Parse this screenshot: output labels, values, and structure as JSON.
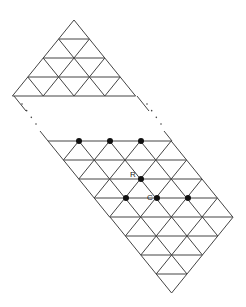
{
  "diagram": {
    "type": "triangular-lattice",
    "line_color": "#444444",
    "dot_color": "#111111",
    "geometry": {
      "half_side": 15.4,
      "row_height": 19
    },
    "top_triangle": {
      "apex": [
        74,
        20
      ],
      "rows": 4
    },
    "ellipsis_left": {
      "from": [
        22,
        104
      ],
      "to": [
        36,
        124
      ],
      "text": "..."
    },
    "ellipsis_right": {
      "from": [
        147,
        104
      ],
      "to": [
        161,
        124
      ],
      "text": "..."
    },
    "gap_edges": [
      {
        "from": [
          14,
          96
        ],
        "to": [
          26,
          111
        ]
      },
      {
        "from": [
          40,
          131
        ],
        "to": [
          48,
          141
        ]
      },
      {
        "from": [
          137,
          96
        ],
        "to": [
          149,
          111
        ]
      },
      {
        "from": [
          164,
          131
        ],
        "to": [
          172,
          141
        ]
      }
    ],
    "parallelogram": {
      "top_left": [
        48,
        141
      ],
      "top_width_cells": 4,
      "rows": 4
    },
    "bottom_triangle": {
      "top_left": [
        110,
        217
      ],
      "cells": 4
    },
    "dots": [
      {
        "x": 79,
        "y": 141
      },
      {
        "x": 110,
        "y": 141
      },
      {
        "x": 141,
        "y": 141
      },
      {
        "x": 141,
        "y": 179,
        "label": "R"
      },
      {
        "x": 126,
        "y": 198
      },
      {
        "x": 157,
        "y": 198,
        "label": "C"
      },
      {
        "x": 188,
        "y": 198
      }
    ],
    "labels": [
      {
        "text": "R",
        "x": 130,
        "y": 177
      },
      {
        "text": "C",
        "x": 147,
        "y": 200
      }
    ]
  }
}
